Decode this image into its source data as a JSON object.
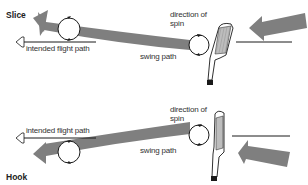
{
  "colors": {
    "arrow_fill": "#7f7f7f",
    "line": "#1a1a1a",
    "background": "#ffffff",
    "club_face": "#b9b9b9"
  },
  "slice": {
    "title": "Slice",
    "intended_flight_path": "intended flight path",
    "swing_path": "swing path",
    "direction_of_spin_line1": "direction of",
    "direction_of_spin_line2": "spin"
  },
  "hook": {
    "title": "Hook",
    "intended_flight_path": "intended flight path",
    "swing_path": "swing path",
    "direction_of_spin_line1": "direction of",
    "direction_of_spin_line2": "spin"
  }
}
